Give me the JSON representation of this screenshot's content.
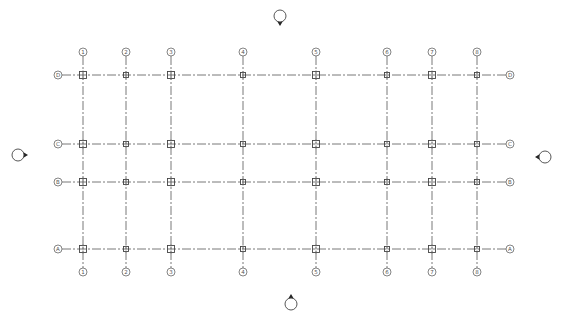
{
  "drawing": {
    "type": "structural column grid plan",
    "line_color": "#555555",
    "background": "#ffffff",
    "columns": [
      {
        "label": "1",
        "x": 83
      },
      {
        "label": "2",
        "x": 126
      },
      {
        "label": "3",
        "x": 171
      },
      {
        "label": "4",
        "x": 243
      },
      {
        "label": "5",
        "x": 316
      },
      {
        "label": "6",
        "x": 387
      },
      {
        "label": "7",
        "x": 432
      },
      {
        "label": "8",
        "x": 477
      }
    ],
    "rows": [
      {
        "label": "D",
        "y": 75
      },
      {
        "label": "C",
        "y": 144
      },
      {
        "label": "B",
        "y": 182
      },
      {
        "label": "A",
        "y": 249
      }
    ],
    "extent": {
      "left": 58,
      "right": 510,
      "top": 52,
      "bottom": 272
    },
    "elevation_markers": [
      {
        "name": "north",
        "x": 280,
        "y": 16,
        "pointer": "down"
      },
      {
        "name": "west",
        "x": 18,
        "y": 155,
        "pointer": "right"
      },
      {
        "name": "east",
        "x": 545,
        "y": 157,
        "pointer": "left"
      },
      {
        "name": "south",
        "x": 291,
        "y": 304,
        "pointer": "up"
      }
    ]
  }
}
